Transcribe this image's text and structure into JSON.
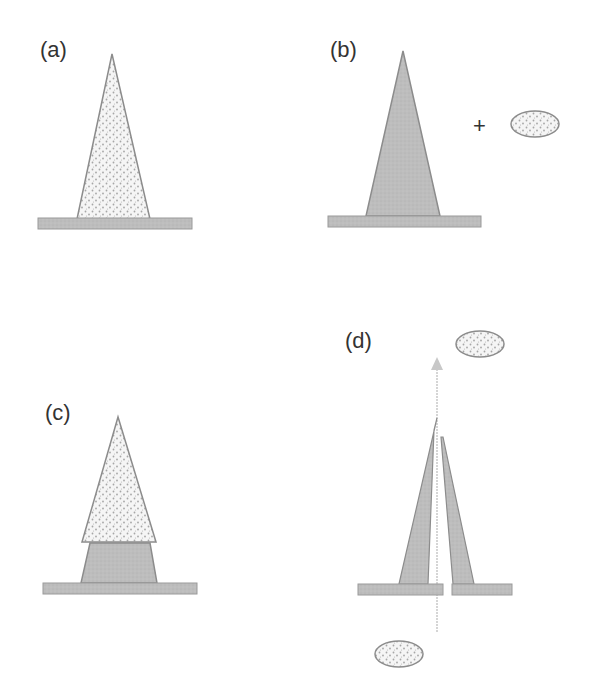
{
  "figure": {
    "panels": [
      {
        "id": "a",
        "label": "(a)",
        "description": "Dotted (particle-filled) cone standing on a substrate"
      },
      {
        "id": "b",
        "label": "(b)",
        "description": "Solid grey cone on substrate, plus a separate dotted particle",
        "operator": "+"
      },
      {
        "id": "c",
        "label": "(c)",
        "description": "Dotted cone stacked on top of a solid grey truncated cone on substrate"
      },
      {
        "id": "d",
        "label": "(d)",
        "description": "Split hollow cone with a central channel; particle passes through along an upward arrow"
      }
    ],
    "colors": {
      "substrate": "#b5b5b5",
      "solid_fill": "#bdbdbd",
      "dotted_fill": "#f4f4f4",
      "dot": "#a8a8a8",
      "stroke": "#8c8c8c",
      "arrow": "#c8c8c8",
      "text": "#333333"
    }
  }
}
